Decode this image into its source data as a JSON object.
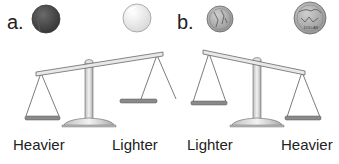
{
  "panels": [
    {
      "label": "a.",
      "objects": [
        {
          "name": "dark ball",
          "side": "left",
          "color": "#4a4a4a"
        },
        {
          "name": "white ball",
          "side": "right",
          "color": "#f2f2f2"
        }
      ],
      "left_label": "Heavier",
      "right_label": "Lighter",
      "tilt": "left side down"
    },
    {
      "label": "b.",
      "objects": [
        {
          "name": "small coin",
          "side": "left",
          "color": "#b5b5b5"
        },
        {
          "name": "large dollar coin",
          "side": "right",
          "color": "#a8a8a8",
          "inscription": "DOLLAR"
        }
      ],
      "left_label": "Lighter",
      "right_label": "Heavier",
      "tilt": "right side down"
    }
  ],
  "colors": {
    "scale_metal": "#d9d9d9",
    "scale_outline": "#555555",
    "pan_fill": "#8a8a8a",
    "text": "#222222"
  }
}
